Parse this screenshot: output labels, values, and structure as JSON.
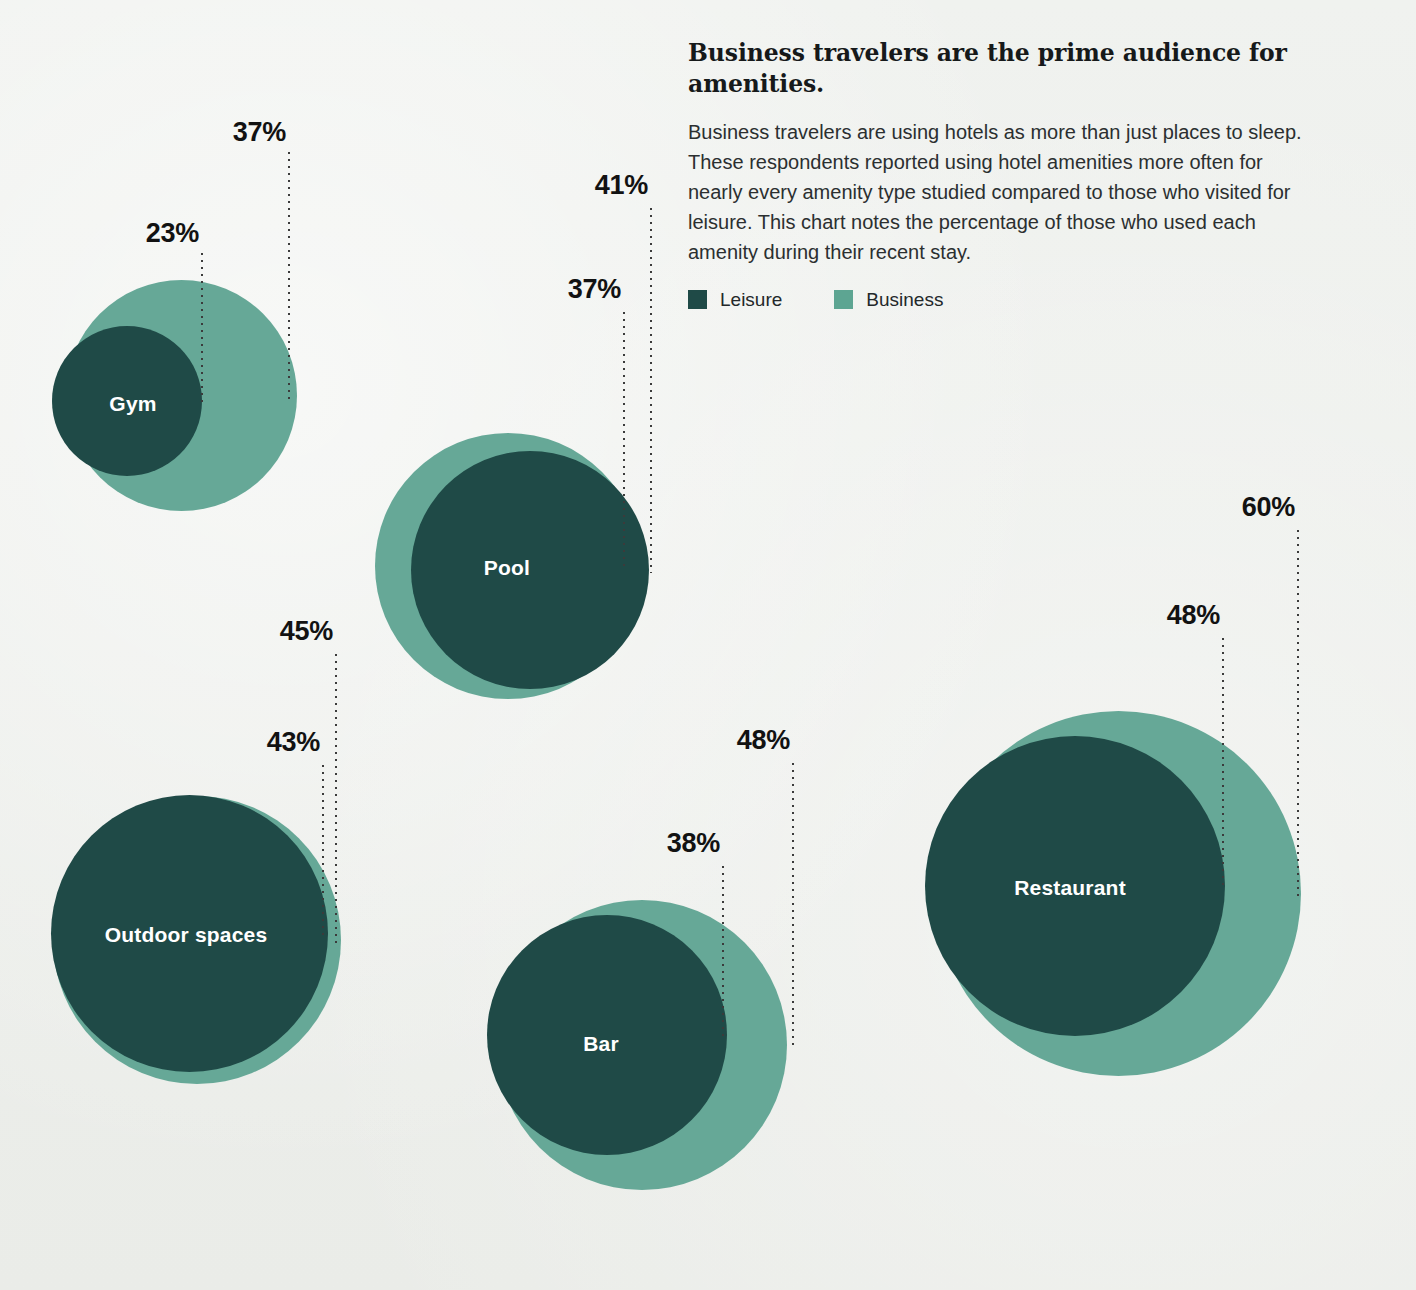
{
  "panel": {
    "heading": "Business travelers are the prime audience for amenities.",
    "body": "Business travelers are using hotels as more than just places to sleep. These respondents reported using hotel amenities more often for nearly every amenity type studied compared to those who visited for leisure. This chart notes the percentage of those who used each amenity during their recent stay.",
    "legend": [
      {
        "label": "Leisure",
        "color": "#1f4a47"
      },
      {
        "label": "Business",
        "color": "#5da592"
      }
    ]
  },
  "chart_data": {
    "type": "bubble",
    "title": "Business travelers are the prime audience for amenities.",
    "xlabel": "",
    "ylabel": "",
    "unit": "%",
    "categories": [
      "Gym",
      "Pool",
      "Outdoor spaces",
      "Bar",
      "Restaurant"
    ],
    "series": [
      {
        "name": "Leisure",
        "color": "#1f4a47",
        "values": [
          23,
          41,
          43,
          38,
          48
        ]
      },
      {
        "name": "Business",
        "color": "#66a897",
        "values": [
          37,
          37,
          45,
          48,
          60
        ]
      }
    ],
    "legend_position": "top-right",
    "grid": false
  },
  "bubbles": [
    {
      "name": "Gym",
      "label": "Gym",
      "label_x": 133,
      "label_y": 404,
      "business": {
        "cx": 181,
        "cy": 395,
        "d": 231,
        "value": "37%",
        "line_x": 288,
        "line_top": 152,
        "line_bottom": 400,
        "label_x": 286,
        "label_y": 117
      },
      "leisure": {
        "cx": 127,
        "cy": 401,
        "d": 150,
        "value": "23%",
        "line_x": 201,
        "line_top": 253,
        "line_bottom": 403,
        "label_x": 199,
        "label_y": 218
      }
    },
    {
      "name": "Pool",
      "label": "Pool",
      "label_x": 507,
      "label_y": 568,
      "business": {
        "cx": 508,
        "cy": 566,
        "d": 266,
        "value": "37%",
        "line_x": 623,
        "line_top": 312,
        "line_bottom": 568,
        "label_x": 621,
        "label_y": 274
      },
      "leisure": {
        "cx": 530,
        "cy": 570,
        "d": 238,
        "value": "41%",
        "line_x": 650,
        "line_top": 208,
        "line_bottom": 573,
        "label_x": 648,
        "label_y": 170
      }
    },
    {
      "name": "Outdoor spaces",
      "label": "Outdoor spaces",
      "label_x": 186,
      "label_y": 935,
      "business": {
        "cx": 197,
        "cy": 940,
        "d": 288,
        "value": "45%",
        "line_x": 335,
        "line_top": 654,
        "line_bottom": 944,
        "label_x": 333,
        "label_y": 616
      },
      "leisure": {
        "cx": 189,
        "cy": 933,
        "d": 277,
        "value": "43%",
        "line_x": 322,
        "line_top": 765,
        "line_bottom": 937,
        "label_x": 320,
        "label_y": 727
      }
    },
    {
      "name": "Bar",
      "label": "Bar",
      "label_x": 601,
      "label_y": 1044,
      "business": {
        "cx": 642,
        "cy": 1045,
        "d": 290,
        "value": "48%",
        "line_x": 792,
        "line_top": 763,
        "line_bottom": 1048,
        "label_x": 790,
        "label_y": 725
      },
      "leisure": {
        "cx": 607,
        "cy": 1035,
        "d": 240,
        "value": "38%",
        "line_x": 722,
        "line_top": 866,
        "line_bottom": 1038,
        "label_x": 720,
        "label_y": 828
      }
    },
    {
      "name": "Restaurant",
      "label": "Restaurant",
      "label_x": 1070,
      "label_y": 888,
      "business": {
        "cx": 1118,
        "cy": 893,
        "d": 365,
        "value": "60%",
        "line_x": 1297,
        "line_top": 530,
        "line_bottom": 898,
        "label_x": 1295,
        "label_y": 492
      },
      "leisure": {
        "cx": 1075,
        "cy": 886,
        "d": 300,
        "value": "48%",
        "line_x": 1222,
        "line_top": 638,
        "line_bottom": 890,
        "label_x": 1220,
        "label_y": 600
      }
    }
  ]
}
